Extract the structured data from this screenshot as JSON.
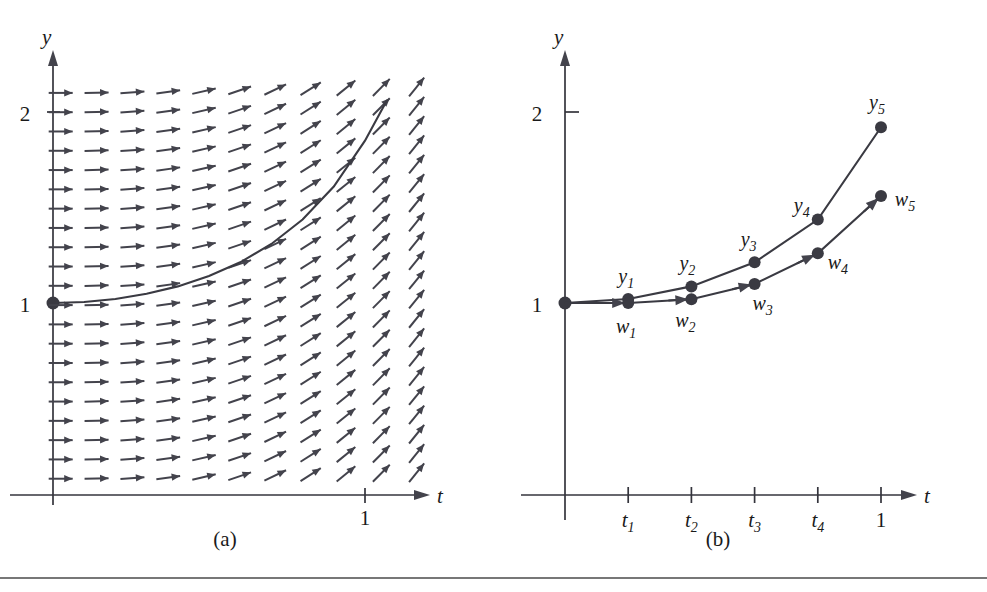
{
  "figure": {
    "background_color": "#ffffff",
    "ink_color": "#3a3a42",
    "width": 987,
    "height": 592,
    "bottom_rule": true
  },
  "panels": [
    {
      "id": "a",
      "caption": "(a)",
      "description": "Direction (slope) field for a first-order ODE with the exact solution curve through the initial point (0, 1)."
    },
    {
      "id": "b",
      "caption": "(b)",
      "description": "Exact solution values y1..y5 compared with Euler's method approximations w1..w5 over five steps."
    }
  ],
  "chart_data": [
    {
      "type": "scatter",
      "panel": "a",
      "title": "",
      "xlabel": "t",
      "ylabel": "y",
      "xlim": [
        0,
        1.33
      ],
      "ylim": [
        0,
        2.22
      ],
      "xticks": [
        1
      ],
      "xticklabels": [
        "1"
      ],
      "yticks": [
        1,
        2
      ],
      "yticklabels": [
        "1",
        "2"
      ],
      "grid": false,
      "legend": null,
      "initial_point": {
        "t": 0,
        "y": 1,
        "marked": true
      },
      "slope_field": {
        "kind": "arrow-grid",
        "columns": 11,
        "rows": 21,
        "t_min": 0.0,
        "t_max": 1.15,
        "y_min": 0.08,
        "y_max": 2.1,
        "slope_rule": "dy/dt grows with t; arrows are horizontal at t=0 and steepen toward the right edge",
        "arrow_color": "#43434c"
      },
      "solution_curve": {
        "label": "exact solution",
        "t": [
          0.0,
          0.1,
          0.2,
          0.3,
          0.4,
          0.5,
          0.6,
          0.7,
          0.8,
          0.9,
          1.0,
          1.07
        ],
        "y": [
          1.0,
          1.005,
          1.021,
          1.048,
          1.087,
          1.141,
          1.213,
          1.309,
          1.437,
          1.61,
          1.85,
          2.06
        ]
      }
    },
    {
      "type": "line",
      "panel": "b",
      "title": "",
      "xlabel": "t",
      "ylabel": "y",
      "xlim": [
        0,
        1.33
      ],
      "ylim": [
        0,
        2.22
      ],
      "xticks": [
        0.2,
        0.4,
        0.6,
        0.8,
        1.0
      ],
      "xticklabels": [
        "t1",
        "t2",
        "t3",
        "t4",
        "1"
      ],
      "yticks": [
        1,
        2
      ],
      "yticklabels": [
        "1",
        "2"
      ],
      "grid": false,
      "legend": null,
      "initial_point": {
        "t": 0,
        "y": 1,
        "marked": true
      },
      "series": [
        {
          "name": "exact solution y",
          "point_labels": [
            "y_1",
            "y_2",
            "y_3",
            "y_4",
            "y_5"
          ],
          "x": [
            0.0,
            0.2,
            0.4,
            0.6,
            0.8,
            1.0
          ],
          "values": [
            1.0,
            1.021,
            1.087,
            1.213,
            1.437,
            1.92
          ],
          "label_position": "above"
        },
        {
          "name": "Euler approximation w",
          "point_labels": [
            "w_1",
            "w_2",
            "w_3",
            "w_4",
            "w_5"
          ],
          "x": [
            0.0,
            0.2,
            0.4,
            0.6,
            0.8,
            1.0
          ],
          "values": [
            1.0,
            1.0,
            1.02,
            1.1,
            1.26,
            1.56
          ],
          "label_position": "below",
          "has_step_arrows": true
        }
      ],
      "annotation": "The Euler polygon w lies below the exact curve y; the gap widens with each step."
    }
  ],
  "labels": {
    "axis_y": "y",
    "axis_t": "t",
    "tick_one": "1",
    "tick_two": "2",
    "t_ticks": [
      "t",
      "t",
      "t",
      "t"
    ],
    "t_tick_subs": [
      "1",
      "2",
      "3",
      "4"
    ],
    "t_last": "1",
    "y_points": [
      "y",
      "y",
      "y",
      "y",
      "y"
    ],
    "y_point_subs": [
      "1",
      "2",
      "3",
      "4",
      "5"
    ],
    "w_points": [
      "w",
      "w",
      "w",
      "w",
      "w"
    ],
    "w_point_subs": [
      "1",
      "2",
      "3",
      "4",
      "5"
    ]
  }
}
